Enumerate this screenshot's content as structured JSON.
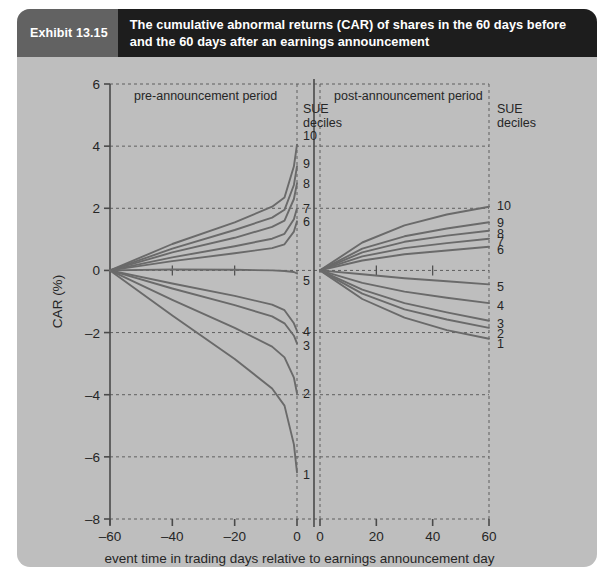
{
  "exhibit": {
    "number_label": "Exhibit 13.15",
    "title": "The cumulative abnormal returns (CAR) of shares in the 60 days before and the 60 days after an earnings announcement"
  },
  "colors": {
    "card_background": "#bebebe",
    "header_dark": "#1d1d1d",
    "header_gray": "#626262",
    "line": "#6a6a6a",
    "axis": "#4a4a4a",
    "grid": "#5f5f5f",
    "text": "#262626"
  },
  "annotations": {
    "pre_panel": "pre-announcement period",
    "post_panel": "post-announcement period",
    "sue_line1": "SUE",
    "sue_line2": "deciles"
  },
  "chart_data": {
    "type": "line",
    "title": "The cumulative abnormal returns (CAR) of shares in the 60 days before and the 60 days after an earnings announcement",
    "xlabel": "event time in trading days relative to earnings announcement day",
    "ylabel": "CAR (%)",
    "ylim": [
      -8,
      6
    ],
    "yticks": [
      6,
      4,
      2,
      0,
      -2,
      -4,
      -6,
      -8
    ],
    "ytick_labels": [
      "6",
      "4",
      "2",
      "0",
      "–2",
      "–4",
      "–6",
      "–8"
    ],
    "grid": true,
    "grid_style": "dashed",
    "legend_position": "inline-right-of-each-panel",
    "panels": [
      {
        "name": "pre-announcement",
        "label": "pre-announcement period",
        "xlim": [
          -60,
          0
        ],
        "xticks": [
          -60,
          -40,
          -20,
          0
        ],
        "xtick_labels": [
          "–60",
          "–40",
          "–20",
          "0"
        ]
      },
      {
        "name": "post-announcement",
        "label": "post-announcement period",
        "xlim": [
          0,
          60
        ],
        "xticks": [
          0,
          20,
          40,
          60
        ],
        "xtick_labels": [
          "0",
          "20",
          "40",
          "60"
        ]
      }
    ],
    "legend_title": "SUE deciles",
    "series": [
      {
        "name": "10",
        "pre_x": [
          -60,
          -40,
          -20,
          -8,
          -4,
          -1,
          0
        ],
        "pre_y": [
          0.0,
          0.85,
          1.55,
          2.05,
          2.35,
          3.35,
          4.05
        ],
        "post_x": [
          0,
          15,
          30,
          45,
          60
        ],
        "post_y": [
          0.0,
          0.9,
          1.45,
          1.8,
          2.05
        ]
      },
      {
        "name": "9",
        "pre_x": [
          -60,
          -40,
          -20,
          -8,
          -4,
          -1,
          0
        ],
        "pre_y": [
          0.0,
          0.7,
          1.3,
          1.7,
          1.95,
          2.75,
          3.35
        ],
        "post_x": [
          0,
          15,
          30,
          45,
          60
        ],
        "post_y": [
          0.0,
          0.7,
          1.1,
          1.35,
          1.55
        ]
      },
      {
        "name": "8",
        "pre_x": [
          -60,
          -40,
          -20,
          -8,
          -4,
          -1,
          0
        ],
        "pre_y": [
          0.0,
          0.58,
          1.05,
          1.4,
          1.6,
          2.3,
          2.8
        ],
        "post_x": [
          0,
          15,
          30,
          45,
          60
        ],
        "post_y": [
          0.0,
          0.58,
          0.92,
          1.12,
          1.28
        ]
      },
      {
        "name": "7",
        "pre_x": [
          -60,
          -40,
          -20,
          -8,
          -4,
          -1,
          0
        ],
        "pre_y": [
          0.0,
          0.42,
          0.78,
          1.02,
          1.18,
          1.65,
          2.0
        ],
        "post_x": [
          0,
          15,
          30,
          45,
          60
        ],
        "post_y": [
          0.0,
          0.45,
          0.72,
          0.88,
          1.02
        ]
      },
      {
        "name": "6",
        "pre_x": [
          -60,
          -40,
          -20,
          -8,
          -4,
          -1,
          0
        ],
        "pre_y": [
          0.0,
          0.3,
          0.55,
          0.72,
          0.84,
          1.25,
          1.58
        ],
        "post_x": [
          0,
          15,
          30,
          45,
          60
        ],
        "post_y": [
          0.0,
          0.32,
          0.52,
          0.64,
          0.76
        ]
      },
      {
        "name": "5",
        "pre_x": [
          -60,
          -40,
          -20,
          -8,
          -4,
          -1,
          0
        ],
        "pre_y": [
          0.0,
          0.03,
          0.02,
          0.0,
          -0.02,
          -0.05,
          -0.1
        ],
        "post_x": [
          0,
          15,
          30,
          45,
          60
        ],
        "post_y": [
          0.0,
          -0.12,
          -0.25,
          -0.35,
          -0.45
        ]
      },
      {
        "name": "4",
        "pre_x": [
          -60,
          -40,
          -20,
          -8,
          -4,
          -1,
          0
        ],
        "pre_y": [
          0.0,
          -0.42,
          -0.82,
          -1.1,
          -1.28,
          -1.7,
          -1.95
        ],
        "post_x": [
          0,
          15,
          30,
          45,
          60
        ],
        "post_y": [
          0.0,
          -0.4,
          -0.68,
          -0.88,
          -1.05
        ]
      },
      {
        "name": "3",
        "pre_x": [
          -60,
          -40,
          -20,
          -8,
          -4,
          -1,
          0
        ],
        "pre_y": [
          0.0,
          -0.58,
          -1.12,
          -1.48,
          -1.7,
          -2.1,
          -2.35
        ],
        "post_x": [
          0,
          15,
          30,
          45,
          60
        ],
        "post_y": [
          0.0,
          -0.62,
          -1.05,
          -1.35,
          -1.62
        ]
      },
      {
        "name": "2",
        "pre_x": [
          -60,
          -40,
          -20,
          -8,
          -4,
          -1,
          0
        ],
        "pre_y": [
          0.0,
          -0.95,
          -1.85,
          -2.45,
          -2.8,
          -3.45,
          -3.95
        ],
        "post_x": [
          0,
          15,
          30,
          45,
          60
        ],
        "post_y": [
          0.0,
          -0.75,
          -1.25,
          -1.58,
          -1.85
        ]
      },
      {
        "name": "1",
        "pre_x": [
          -60,
          -40,
          -20,
          -8,
          -4,
          -1,
          0
        ],
        "pre_y": [
          0.0,
          -1.45,
          -2.85,
          -3.8,
          -4.35,
          -5.6,
          -6.5
        ],
        "post_x": [
          0,
          15,
          30,
          45,
          60
        ],
        "post_y": [
          0.0,
          -0.92,
          -1.52,
          -1.92,
          -2.2
        ]
      }
    ],
    "left_decile_label_values": {
      "10": 4.35,
      "9": 3.45,
      "8": 2.82,
      "7": 2.02,
      "6": 1.6,
      "5": -0.3,
      "4": -1.95,
      "3": -2.4,
      "2": -3.95,
      "1": -6.55
    },
    "right_decile_label_values": {
      "10": 2.1,
      "9": 1.55,
      "8": 1.22,
      "7": 0.95,
      "6": 0.7,
      "5": -0.5,
      "4": -1.1,
      "3": -1.7,
      "2": -2.0,
      "1": -2.35
    }
  }
}
